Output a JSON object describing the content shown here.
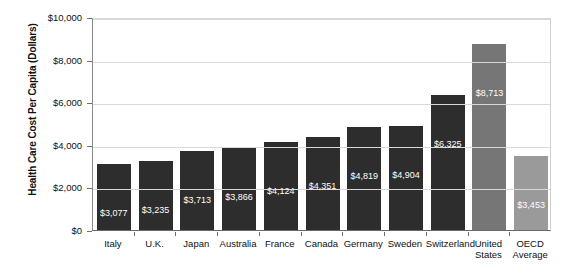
{
  "chart_data": {
    "type": "bar",
    "title": "",
    "xlabel": "",
    "ylabel": "Health Care Cost Per Capita (Dollars)",
    "ylim": [
      0,
      10000
    ],
    "grid": true,
    "legend": "none",
    "ytick_labels": [
      "$10,000",
      "$8,000",
      "$6,000",
      "$4,000",
      "$2,000",
      "$0"
    ],
    "ytick_values": [
      10000,
      8000,
      6000,
      4000,
      2000,
      0
    ],
    "categories": [
      "Italy",
      "U.K.",
      "Japan",
      "Australia",
      "France",
      "Canada",
      "Germany",
      "Sweden",
      "Switzerland",
      "United States",
      "OECD Average"
    ],
    "category_lines": [
      [
        "Italy"
      ],
      [
        "U.K."
      ],
      [
        "Japan"
      ],
      [
        "Australia"
      ],
      [
        "France"
      ],
      [
        "Canada"
      ],
      [
        "Germany"
      ],
      [
        "Sweden"
      ],
      [
        "Switzerland"
      ],
      [
        "United",
        "States"
      ],
      [
        "OECD",
        "Average"
      ]
    ],
    "values": [
      3077,
      3235,
      3713,
      3866,
      4124,
      4351,
      4819,
      4904,
      6325,
      8713,
      3453
    ],
    "value_labels": [
      "$3,077",
      "$3,235",
      "$3,713",
      "$3,866",
      "$4,124",
      "$4,351",
      "$4,819",
      "$4,904",
      "$6,325",
      "$8,713",
      "$3,453"
    ],
    "bar_styles": [
      "dark",
      "dark",
      "dark",
      "dark",
      "dark",
      "dark",
      "dark",
      "dark",
      "dark",
      "mid",
      "light"
    ]
  },
  "colors": {
    "bar_dark": "#2d2d2d",
    "bar_mid": "#767676",
    "bar_light": "#9a9a9a",
    "gridline": "#d9d9d9",
    "axis": "#6a6a6a",
    "value_label": "#ffffff",
    "background": "#ffffff"
  }
}
